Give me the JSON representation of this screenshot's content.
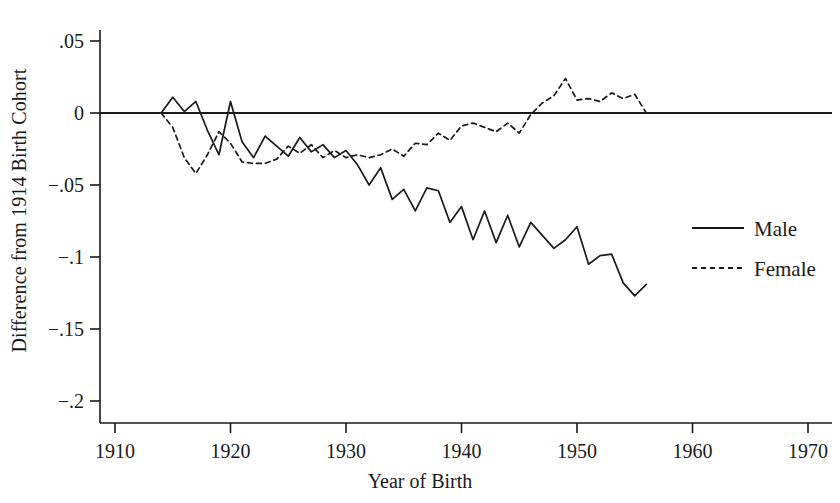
{
  "chart_data": {
    "type": "line",
    "title": "",
    "xlabel": "Year of Birth",
    "ylabel": "Difference from 1914 Birth Cohort",
    "xlim": [
      1910,
      1970
    ],
    "ylim": [
      -0.2,
      0.05
    ],
    "xticks": [
      1910,
      1920,
      1930,
      1940,
      1950,
      1960,
      1970
    ],
    "xtick_labels": [
      "1910",
      "1920",
      "1930",
      "1940",
      "1950",
      "1960",
      "1970"
    ],
    "yticks": [
      0.05,
      0,
      -0.05,
      -0.1,
      -0.15,
      -0.2
    ],
    "ytick_labels": [
      ".05",
      "0",
      "−.05",
      "−.1",
      "−.15",
      "−.2"
    ],
    "grid": false,
    "zero_line": true,
    "legend_position": "right",
    "legend": [
      "Male",
      "Female"
    ],
    "x": [
      1914,
      1915,
      1916,
      1917,
      1918,
      1919,
      1920,
      1921,
      1922,
      1923,
      1924,
      1925,
      1926,
      1927,
      1928,
      1929,
      1930,
      1931,
      1932,
      1933,
      1934,
      1935,
      1936,
      1937,
      1938,
      1939,
      1940,
      1941,
      1942,
      1943,
      1944,
      1945,
      1946,
      1947,
      1948,
      1949,
      1950,
      1951,
      1952,
      1953,
      1954,
      1955,
      1956
    ],
    "series": [
      {
        "name": "Male",
        "style": "solid",
        "color": "#1a1a1a",
        "values": [
          0.0,
          0.011,
          0.001,
          0.008,
          -0.012,
          -0.029,
          0.008,
          -0.02,
          -0.031,
          -0.016,
          -0.023,
          -0.03,
          -0.017,
          -0.027,
          -0.022,
          -0.031,
          -0.026,
          -0.036,
          -0.05,
          -0.038,
          -0.06,
          -0.053,
          -0.068,
          -0.052,
          -0.054,
          -0.076,
          -0.065,
          -0.088,
          -0.068,
          -0.09,
          -0.071,
          -0.093,
          -0.076,
          -0.085,
          -0.094,
          -0.088,
          -0.079,
          -0.105,
          -0.099,
          -0.098,
          -0.118,
          -0.127,
          -0.119
        ]
      },
      {
        "name": "Female",
        "style": "dashed",
        "color": "#1a1a1a",
        "values": [
          0.0,
          -0.01,
          -0.031,
          -0.042,
          -0.029,
          -0.013,
          -0.021,
          -0.034,
          -0.035,
          -0.035,
          -0.032,
          -0.023,
          -0.028,
          -0.022,
          -0.031,
          -0.026,
          -0.031,
          -0.029,
          -0.031,
          -0.029,
          -0.025,
          -0.03,
          -0.021,
          -0.022,
          -0.014,
          -0.019,
          -0.009,
          -0.007,
          -0.01,
          -0.013,
          -0.007,
          -0.014,
          -0.001,
          0.007,
          0.012,
          0.024,
          0.009,
          0.01,
          0.008,
          0.014,
          0.01,
          0.013,
          0.0
        ]
      }
    ]
  },
  "axes": {
    "x_axis_name": "Year of Birth",
    "y_axis_name": "Difference from 1914 Birth Cohort"
  }
}
